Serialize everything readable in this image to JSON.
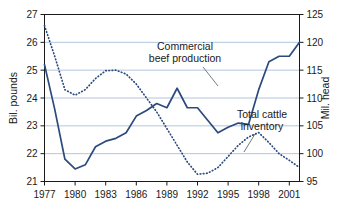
{
  "chart_data": {
    "type": "line",
    "title": "",
    "xlabel": "",
    "ylabel": "Bil. pounds",
    "y2label": "Mil. head",
    "grid": true,
    "legend_position": "inline-annotations",
    "x": [
      1977,
      1978,
      1979,
      1980,
      1981,
      1982,
      1983,
      1984,
      1985,
      1986,
      1987,
      1988,
      1989,
      1990,
      1991,
      1992,
      1993,
      1994,
      1995,
      1996,
      1997,
      1998,
      1999,
      2000,
      2001,
      2002
    ],
    "xlim": [
      1977,
      2002
    ],
    "xticks": [
      1977,
      1980,
      1983,
      1986,
      1989,
      1992,
      1995,
      1998,
      2001
    ],
    "xtick_labels": [
      "1977",
      "1980",
      "1983",
      "1986",
      "1989",
      "1992",
      "1995",
      "1998",
      "2001"
    ],
    "ylim": [
      21,
      27
    ],
    "yticks": [
      21,
      22,
      23,
      24,
      25,
      26,
      27
    ],
    "ytick_labels": [
      "21",
      "22",
      "23",
      "24",
      "25",
      "26",
      "27"
    ],
    "y2lim": [
      95,
      125
    ],
    "y2ticks": [
      95,
      100,
      105,
      110,
      115,
      120,
      125
    ],
    "y2tick_labels": [
      "95",
      "100",
      "105",
      "110",
      "115",
      "120",
      "125"
    ],
    "series": [
      {
        "name": "Commercial beef production",
        "axis": "left",
        "style": "solid",
        "color": "#2b4a7d",
        "values": [
          25.2,
          23.6,
          21.8,
          21.45,
          21.6,
          22.25,
          22.45,
          22.55,
          22.75,
          23.35,
          23.55,
          23.8,
          23.65,
          24.35,
          23.65,
          23.65,
          23.2,
          22.75,
          22.95,
          23.1,
          23.05,
          24.3,
          25.3,
          25.5,
          25.5,
          26.0
        ]
      },
      {
        "name": "Total cattle inventory",
        "axis": "right",
        "style": "dotted",
        "color": "#2b4a7d",
        "values": [
          123.0,
          117.5,
          111.5,
          110.5,
          111.5,
          113.5,
          114.9,
          115.0,
          114.3,
          112.5,
          110.0,
          107.5,
          104.5,
          101.5,
          98.5,
          96.3,
          96.5,
          97.5,
          99.5,
          101.5,
          103.0,
          103.8,
          102.0,
          100.0,
          98.8,
          97.5
        ]
      }
    ],
    "annotations": [
      {
        "name": "commercial-beef-production-label",
        "text_line1": "Commercial",
        "text_line2": "beef production"
      },
      {
        "name": "total-cattle-inventory-label",
        "text_line1": "Total cattle",
        "text_line2": "inventory"
      }
    ],
    "colors": {
      "line": "#2b4a7d",
      "grid": "#a9bfd9",
      "frame": "#1a1a1a",
      "text": "#1a1a1a",
      "background": "#ffffff"
    }
  }
}
